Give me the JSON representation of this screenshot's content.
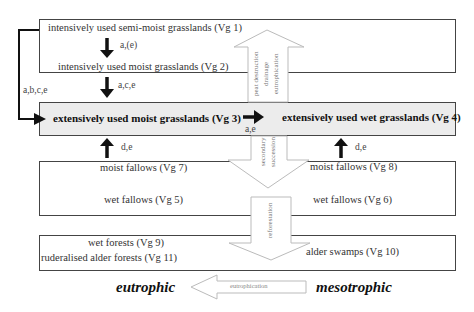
{
  "diagram": {
    "boxes": {
      "top": {
        "vg1": "intensively used semi-moist grasslands (Vg 1)",
        "vg2": "intensively used moist grasslands (Vg 2)"
      },
      "middle": {
        "vg3": "extensively used moist grasslands (Vg 3)",
        "vg4": "extensively used wet grasslands (Vg 4)"
      },
      "fallows": {
        "vg7": "moist fallows (Vg 7)",
        "vg5": "wet fallows (Vg 5)",
        "vg8": "moist fallows (Vg 8)",
        "vg6": "wet fallows (Vg 6)"
      },
      "forests": {
        "vg9": "wet forests (Vg 9)",
        "vg11": "ruderalised alder forests (Vg 11)",
        "vg10": "alder swamps (Vg 10)"
      }
    },
    "arrow_labels": {
      "vg1_to_vg2": "a,(e)",
      "vg2_to_vg3": "a,c,e",
      "vg1_to_vg3_side": "a,b,c,e",
      "vg3_to_vg4": "a,e",
      "vg7_to_vg3": "d,e",
      "vg8_to_vg4": "d,e"
    },
    "block_arrows": {
      "up": [
        "peat destruction",
        "drainage",
        "eutrophication"
      ],
      "secondary": [
        "secondary",
        "succession"
      ],
      "reforestation": [
        "reforestation"
      ],
      "bottom": "eutrophication"
    },
    "axis": {
      "left": "eutrophic",
      "right": "mesotrophic"
    }
  }
}
